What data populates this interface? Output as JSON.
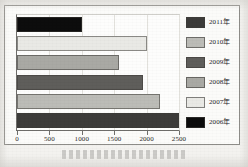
{
  "chart_data": {
    "type": "bar",
    "orientation": "horizontal",
    "title": "",
    "xlabel": "",
    "ylabel": "",
    "xlim": [
      0,
      2500
    ],
    "grid": true,
    "legend_position": "right",
    "xticks": [
      "0",
      "500",
      "1000",
      "1500",
      "2000",
      "2500"
    ],
    "xtick_values": [
      0,
      500,
      1000,
      1500,
      2000,
      2500
    ],
    "categories": [
      "2006年",
      "2007年",
      "2008年",
      "2009年",
      "2010年",
      "2011年"
    ],
    "values": [
      1000,
      2000,
      1580,
      1950,
      2200,
      2500
    ],
    "bars": [
      {
        "category": "2006年",
        "value": 1000,
        "color": "#0d0d0d"
      },
      {
        "category": "2007年",
        "value": 2000,
        "color": "#e9e9e5"
      },
      {
        "category": "2008年",
        "value": 1580,
        "color": "#a9a9a4"
      },
      {
        "category": "2009年",
        "value": 1950,
        "color": "#5f5e5b"
      },
      {
        "category": "2010年",
        "value": 2200,
        "color": "#bcbcb7"
      },
      {
        "category": "2011年",
        "value": 2500,
        "color": "#3d3c3a"
      }
    ],
    "legend": [
      {
        "label": "2011年",
        "color": "#3d3c3a"
      },
      {
        "label": "2010年",
        "color": "#bcbcb7"
      },
      {
        "label": "2009年",
        "color": "#5f5e5b"
      },
      {
        "label": "2008年",
        "color": "#a9a9a4"
      },
      {
        "label": "2007年",
        "color": "#e9e9e5"
      },
      {
        "label": "2006年",
        "color": "#0d0d0d"
      }
    ]
  }
}
